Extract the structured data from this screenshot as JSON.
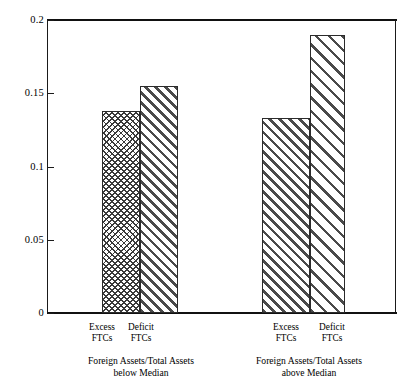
{
  "chart_data": {
    "type": "bar",
    "title": "",
    "subtitle": "",
    "xlabel": "",
    "ylabel": "",
    "ylim": [
      0,
      0.2
    ],
    "grid": false,
    "legend": "none",
    "y_ticks": [
      "0",
      "0.05",
      "0.1",
      "0.15",
      "0.2"
    ],
    "y_tick_values": [
      0,
      0.05,
      0.1,
      0.15,
      0.2
    ],
    "categories": [
      "Excess FTCs",
      "Deficit FTCs",
      "Excess FTCs",
      "Deficit FTCs"
    ],
    "values": [
      0.138,
      0.155,
      0.133,
      0.19
    ],
    "groups": [
      {
        "caption_line1": "Foreign Assets/Total Assets",
        "caption_line2": "below Median",
        "bars": [
          {
            "label_line1": "Excess",
            "label_line2": "FTCs",
            "value": 0.138,
            "pattern": "cross-hatch"
          },
          {
            "label_line1": "Deficit",
            "label_line2": "FTCs",
            "value": 0.155,
            "pattern": "diagonal-dense"
          }
        ]
      },
      {
        "caption_line1": "Foreign Assets/Total Assets",
        "caption_line2": "above Median",
        "bars": [
          {
            "label_line1": "Excess",
            "label_line2": "FTCs",
            "value": 0.133,
            "pattern": "diagonal-dense"
          },
          {
            "label_line1": "Deficit",
            "label_line2": "FTCs",
            "value": 0.19,
            "pattern": "diagonal-wide"
          }
        ]
      }
    ],
    "colors": {
      "axis": "#111111",
      "hatch": "#3a3a3a",
      "bar_fill": "#ffffff",
      "bar_edge": "#2b2b2b",
      "text": "#000000"
    }
  }
}
